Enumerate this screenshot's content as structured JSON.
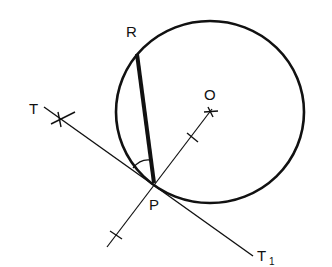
{
  "diagram": {
    "type": "geometry-construction",
    "colors": {
      "stroke": "#111111",
      "background": "#ffffff"
    },
    "circle": {
      "center_label": "O",
      "cx": 210,
      "cy": 112,
      "r": 93
    },
    "points": {
      "P": {
        "label": "P",
        "x": 153,
        "y": 183
      },
      "R": {
        "label": "R",
        "x": 137,
        "y": 54
      },
      "O": {
        "label": "O",
        "x": 210,
        "y": 112
      },
      "T": {
        "label": "T",
        "x": 60,
        "y": 118
      }
    },
    "lines": {
      "tangent": {
        "from_label": "T",
        "to_label": "T1",
        "to_label_main": "T",
        "to_label_sub": "1"
      },
      "chord": {
        "from": "P",
        "to": "R",
        "style": "bold"
      },
      "radius_line": {
        "from": "O",
        "through": "P",
        "ticks": 2
      }
    },
    "labels": {
      "R": "R",
      "O": "O",
      "T": "T",
      "P": "P",
      "T1_main": "T",
      "T1_sub": "1"
    },
    "angle_mark": {
      "between": [
        "tangent PT",
        "chord PR"
      ],
      "vertex": "P"
    }
  }
}
